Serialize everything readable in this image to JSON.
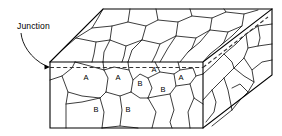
{
  "figure": {
    "type": "line-diagram",
    "background_color": "#ffffff",
    "line_color": "#000000",
    "grain_line_color": "#1a1a1a",
    "dash_color": "#333333",
    "width": 282,
    "height": 136
  },
  "callout": {
    "label": "Junction",
    "label_x": 17,
    "label_y": 27,
    "leader_path": "M 21 33 C 22 44, 30 58, 46 66",
    "arrow_tip_x": 50,
    "arrow_tip_y": 67
  },
  "block": {
    "front_face": {
      "name": "front-face",
      "path": "M 50 62 L 203 62 L 203 128 L 50 128 Z",
      "left_x": 50,
      "right_x": 203,
      "top_y": 62,
      "bottom_y": 128
    },
    "top_face": {
      "name": "top-face",
      "path": "M 50 62 L 103 9 L 272 9 L 203 62 Z"
    },
    "right_face": {
      "name": "right-face",
      "path": "M 203 62 L 272 9 L 272 75 L 203 128 Z"
    },
    "outline_path": "M 50 62 L 103 9 L 272 9 L 272 75 L 203 128 L 50 128 Z",
    "hidden_edges_path": "M 50 62 L 203 62 L 203 128 M 203 62 L 272 9"
  },
  "junction": {
    "front_dash_path": "M 50 67.5 L 203 67.5",
    "right_dash_path": "M 203 67.5 L 268 17",
    "description": "Dashed line marking the grain-boundary junction plane"
  },
  "grain_labels": [
    {
      "id": "a1",
      "text": "A",
      "x": 86,
      "y": 78
    },
    {
      "id": "a2",
      "text": "A",
      "x": 118,
      "y": 78
    },
    {
      "id": "a3",
      "text": "A",
      "x": 154,
      "y": 70
    },
    {
      "id": "a4",
      "text": "A",
      "x": 181,
      "y": 78
    },
    {
      "id": "b1",
      "text": "B",
      "x": 140,
      "y": 84
    },
    {
      "id": "b2",
      "text": "B",
      "x": 163,
      "y": 90
    },
    {
      "id": "b3",
      "text": "B",
      "x": 96,
      "y": 110
    },
    {
      "id": "b4",
      "text": "B",
      "x": 128,
      "y": 110
    }
  ],
  "grain_boundaries": {
    "front_face_paths": [
      "M 50 80 L 62 76 L 72 68 L 75 62",
      "M 62 76 L 68 92 L 66 104 L 66 128",
      "M 68 92 L 82 96 L 100 98 L 106 92",
      "M 106 92 L 108 78 L 104 70 L 103 62",
      "M 104 70 L 90 66 L 75 62",
      "M 106 92 L 120 96 L 131 92",
      "M 131 92 L 133 80 L 129 70 L 128 62",
      "M 129 70 L 114 67 L 104 70",
      "M 131 92 L 140 98 L 148 98",
      "M 148 98 L 152 88 L 148 78 L 140 74 L 133 80",
      "M 148 78 L 160 72 L 156 64 L 155 62",
      "M 160 72 L 174 74 L 180 70 L 178 62",
      "M 174 74 L 176 86 L 170 94 L 158 96 L 148 98",
      "M 176 86 L 190 84 L 196 76 L 193 68 L 180 70",
      "M 196 76 L 203 74",
      "M 190 84 L 194 98 L 203 104",
      "M 66 104 L 82 102 L 100 98",
      "M 100 98 L 104 112 L 102 128",
      "M 102 128 L 120 126 L 138 128",
      "M 120 96 L 122 110 L 120 126",
      "M 148 98 L 156 112 L 152 128",
      "M 170 94 L 174 110 L 170 122 L 172 128",
      "M 194 98 L 188 112 L 190 128"
    ],
    "top_face_paths": [
      "M 103 9 L 98 18 L 92 28 L 76 38 L 62 50 L 50 62",
      "M 92 28 L 112 26 L 128 22 L 130 9",
      "M 112 26 L 110 40 L 104 52 L 103 62",
      "M 76 38 L 96 42 L 110 40",
      "M 96 42 L 94 54 L 92 62",
      "M 128 22 L 146 26 L 158 20 L 156 9",
      "M 146 26 L 142 40 L 132 50 L 128 62",
      "M 110 40 L 126 46 L 142 40",
      "M 126 46 L 124 56 L 122 62",
      "M 158 20 L 178 22 L 192 16 L 190 9",
      "M 178 22 L 176 36 L 168 48 L 160 62",
      "M 142 40 L 160 44 L 176 36",
      "M 160 44 L 156 54 L 152 62",
      "M 192 16 L 212 18 L 226 12 L 224 9",
      "M 212 18 L 210 30 L 200 42 L 188 52 L 180 62",
      "M 176 36 L 196 38 L 210 30",
      "M 196 38 L 192 48 L 188 52",
      "M 226 12 L 244 14 L 258 10",
      "M 244 14 L 242 26 L 232 36 L 220 46 L 210 54 L 203 62",
      "M 210 30 L 228 32 L 242 26",
      "M 228 32 L 224 42 L 220 46"
    ],
    "right_face_paths": [
      "M 272 24 L 258 26 L 246 34 L 236 44 L 224 54 L 214 64 L 203 74",
      "M 246 34 L 248 48 L 244 58 L 234 68 L 224 78 L 212 90 L 203 100",
      "M 224 54 L 232 62 L 234 68",
      "M 272 44 L 258 46 L 248 48",
      "M 258 26 L 260 38 L 258 46",
      "M 272 60 L 262 62 L 252 70 L 244 58",
      "M 252 70 L 254 82 L 248 92 L 240 100 L 232 110",
      "M 234 68 L 244 76 L 254 82",
      "M 224 78 L 228 90 L 232 110",
      "M 232 110 L 222 118 L 212 126",
      "M 212 90 L 216 102 L 214 112 L 206 122",
      "M 248 92 L 240 84 L 232 88"
    ]
  }
}
